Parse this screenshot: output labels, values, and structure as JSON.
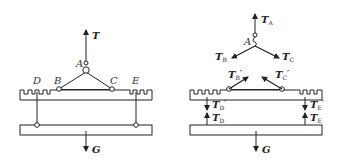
{
  "figure_left": {
    "title": "Lifting assembly",
    "point_labels": {
      "A": "A",
      "B": "B",
      "C": "C",
      "D": "D",
      "E": "E"
    },
    "forces": {
      "T": "T",
      "G": "G"
    }
  },
  "figure_right": {
    "title": "Free-body diagrams",
    "point_labels": {
      "A": "A"
    },
    "forces": {
      "TA": {
        "main": "T",
        "sub": "A"
      },
      "TB": {
        "main": "T",
        "sub": "B"
      },
      "TC": {
        "main": "T",
        "sub": "C"
      },
      "TB_prime": {
        "main": "T",
        "sub": "B",
        "prime": "′"
      },
      "TC_prime": {
        "main": "T",
        "sub": "C",
        "prime": "′"
      },
      "TD_prime": {
        "main": "T",
        "sub": "D",
        "prime": "′"
      },
      "TE_prime": {
        "main": "T",
        "sub": "E",
        "prime": "′"
      },
      "TD": {
        "main": "T",
        "sub": "D"
      },
      "TE": {
        "main": "T",
        "sub": "E"
      },
      "G": {
        "main": "G"
      }
    }
  }
}
